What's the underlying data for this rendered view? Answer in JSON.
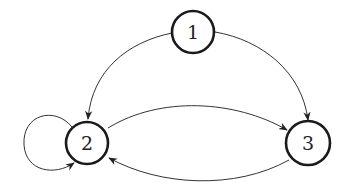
{
  "diagram": {
    "type": "directed-graph",
    "colors": {
      "node_stroke": "#1a1a1a",
      "edge": "#333333",
      "label": "#222222",
      "background": "#ffffff"
    },
    "nodes": [
      {
        "id": "1",
        "label": "1",
        "cx": 193,
        "cy": 32,
        "r": 21
      },
      {
        "id": "2",
        "label": "2",
        "cx": 87,
        "cy": 143,
        "r": 21
      },
      {
        "id": "3",
        "label": "3",
        "cx": 308,
        "cy": 143,
        "r": 22
      }
    ],
    "edges": [
      {
        "from": "1",
        "to": "2",
        "label": ""
      },
      {
        "from": "1",
        "to": "3",
        "label": ""
      },
      {
        "from": "2",
        "to": "3",
        "label": ""
      },
      {
        "from": "3",
        "to": "2",
        "label": ""
      },
      {
        "from": "2",
        "to": "2",
        "label": "",
        "self_loop": true
      }
    ]
  }
}
